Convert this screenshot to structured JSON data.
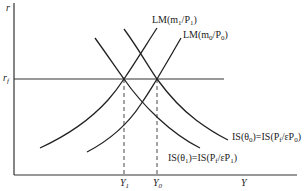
{
  "diagram": {
    "type": "IS-LM diagram",
    "axes": {
      "y_label": "r",
      "x_label": "Y",
      "rf_label": "r",
      "rf_sub": "f"
    },
    "curves": {
      "lm1": {
        "prefix": "LM(m",
        "sub1": "1",
        "mid": "/P",
        "sub2": "1",
        "suffix": ")"
      },
      "lm0": {
        "prefix": "LM(m",
        "sub1": "0",
        "mid": "/P",
        "sub2": "0",
        "suffix": ")"
      },
      "is0": {
        "prefix": "IS(θ",
        "sub1": "0",
        "mid": ")=IS(P",
        "sub2": "f",
        "mid2": "/εP",
        "sub3": "0",
        "suffix": ")"
      },
      "is1": {
        "prefix": "IS(θ",
        "sub1": "1",
        "mid": ")=IS(P",
        "sub2": "f",
        "mid2": "/εP",
        "sub3": "1",
        "suffix": ")"
      }
    },
    "x_ticks": {
      "y1": {
        "main": "Y",
        "sub": "1"
      },
      "y0": {
        "main": "Y",
        "sub": "0"
      }
    },
    "colors": {
      "line": "#222222",
      "background": "#ffffff"
    }
  }
}
